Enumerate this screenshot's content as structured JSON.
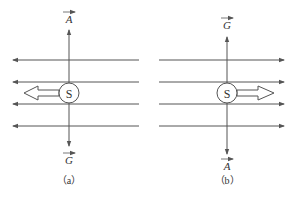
{
  "figure_a": {
    "caption": "（a）",
    "top_label": "A",
    "bottom_label": "G",
    "field_direction": "left",
    "motion_direction": "left",
    "symbol": "S"
  },
  "figure_b": {
    "caption": "（b）",
    "top_label": "G",
    "bottom_label": "A",
    "field_direction": "right",
    "motion_direction": "right",
    "symbol": "S"
  },
  "colors": {
    "stroke": "#555555",
    "background": "#ffffff"
  }
}
